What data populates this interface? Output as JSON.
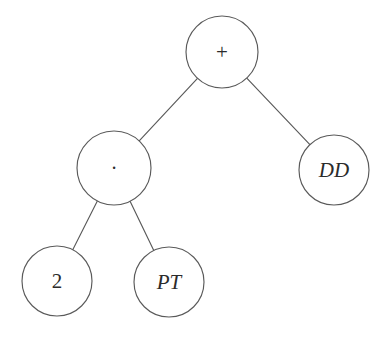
{
  "figure": {
    "kind": "expression-tree",
    "background_color": "#ffffff",
    "stroke_color": "#5a5a5a",
    "text_color": "#2b2b2b",
    "width": 391,
    "height": 341
  },
  "nodes": [
    {
      "id": "root",
      "label": "+",
      "role": "operator-plus",
      "style": "upright",
      "font_size": 21,
      "cx": 222,
      "cy": 52,
      "r": 36
    },
    {
      "id": "mul",
      "label": "·",
      "role": "operator-times",
      "style": "upright",
      "font_size": 20,
      "cx": 114,
      "cy": 168,
      "r": 37
    },
    {
      "id": "dd",
      "label": "DD",
      "role": "variable",
      "style": "italic",
      "font_size": 21,
      "cx": 334,
      "cy": 170,
      "r": 35
    },
    {
      "id": "two",
      "label": "2",
      "role": "constant",
      "style": "upright",
      "font_size": 21,
      "cx": 57,
      "cy": 281,
      "r": 35
    },
    {
      "id": "pt",
      "label": "PT",
      "role": "variable",
      "style": "italic",
      "font_size": 21,
      "cx": 169,
      "cy": 282,
      "r": 35
    }
  ],
  "edges": [
    {
      "id": "root-mul",
      "from": "root",
      "to": "mul"
    },
    {
      "id": "root-dd",
      "from": "root",
      "to": "dd"
    },
    {
      "id": "mul-two",
      "from": "mul",
      "to": "two"
    },
    {
      "id": "mul-pt",
      "from": "mul",
      "to": "pt"
    }
  ]
}
